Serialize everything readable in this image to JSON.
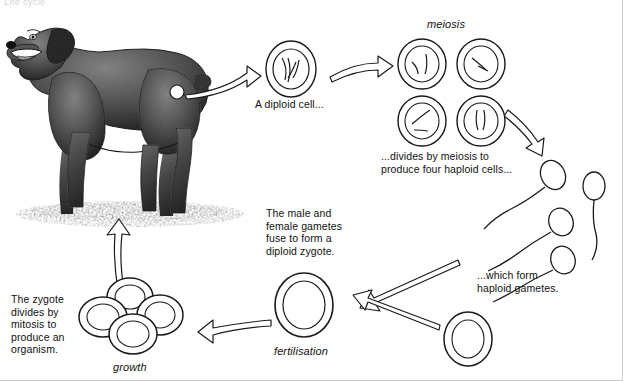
{
  "figure": {
    "title_cut_off": "Life cycle",
    "type": "biology-life-cycle-diagram"
  },
  "labels": {
    "diploid_cell": "A diploid cell...",
    "meiosis": "meiosis",
    "meiosis_caption": "...divides by meiosis to\nproduce four haploid cells...",
    "haploid_gametes": "...which form\nhaploid gametes.",
    "fuse_text": "The male and\nfemale gametes\nfuse to form a\ndiploid zygote.",
    "fertilisation": "fertilisation",
    "zygote_text": "The zygote\ndivides by\nmitosis to\nproduce an\norganism.",
    "growth": "growth"
  },
  "stages": [
    {
      "id": "organism",
      "name": "adult dog organism",
      "ploidy": "diploid"
    },
    {
      "id": "diploid-cell",
      "name": "A diploid cell...",
      "ploidy": "diploid"
    },
    {
      "id": "meiosis-cells",
      "name": "four haploid cells",
      "ploidy": "haploid",
      "count": 4
    },
    {
      "id": "gametes",
      "name": "haploid gametes (sperm)",
      "ploidy": "haploid",
      "count": 4
    },
    {
      "id": "egg",
      "name": "haploid gamete (egg)",
      "ploidy": "haploid",
      "count": 1
    },
    {
      "id": "zygote",
      "name": "diploid zygote",
      "ploidy": "diploid"
    },
    {
      "id": "growth-cells",
      "name": "dividing cells (growth)",
      "ploidy": "diploid",
      "count": 4
    }
  ],
  "colors": {
    "ink": "#111111",
    "background": "#ffffff",
    "border": "#c9c9c9"
  }
}
